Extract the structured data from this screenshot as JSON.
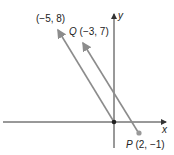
{
  "diagram": {
    "type": "coordinate-plane-vectors",
    "axes": {
      "x_label": "x",
      "y_label": "y"
    },
    "points": [
      {
        "name": "origin",
        "coords": [
          0,
          0
        ]
      },
      {
        "name": "P",
        "label": "P (2, −1)",
        "coords": [
          2,
          -1
        ]
      },
      {
        "name": "Q",
        "label": "Q (−3, 7)",
        "coords": [
          -3,
          7
        ]
      },
      {
        "name": "tip",
        "label": "(−5, 8)",
        "coords": [
          -5,
          8
        ]
      }
    ],
    "vectors": [
      {
        "from": "origin",
        "to": "tip",
        "label": "(−5, 8)"
      },
      {
        "from": "P",
        "to": "Q",
        "label": "PQ"
      }
    ],
    "colors": {
      "axis": "#333333",
      "vector": "#8c8c8c",
      "point": "#999999",
      "origin_dot": "#222222"
    }
  },
  "labels": {
    "tip": "(−5, 8)",
    "q_letter": "Q",
    "q_coords": "(−3, 7)",
    "p_letter": "P",
    "p_coords": "(2, −1)",
    "x_axis": "x",
    "y_axis": "y"
  }
}
